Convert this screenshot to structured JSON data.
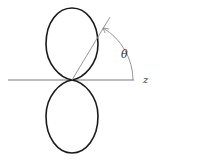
{
  "diagram": {
    "type": "dipole-radiation-pattern",
    "axis_label": "z",
    "angle_label": "θ",
    "colors": {
      "lobe_stroke": "#1a1a1a",
      "axis_stroke": "#7a7a7a",
      "line_stroke": "#8a8a8a",
      "label": "#333333",
      "background": "#ffffff"
    }
  }
}
